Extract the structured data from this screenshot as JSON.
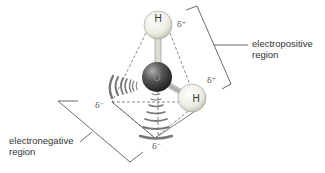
{
  "diagram": {
    "atoms": [
      {
        "id": "h_top",
        "label": "H"
      },
      {
        "id": "oxygen",
        "label": "O"
      },
      {
        "id": "h_right",
        "label": "H"
      }
    ],
    "charges": {
      "h_top": "δ⁺",
      "h_right": "δ⁺",
      "lone_pair_left": "δ⁻",
      "lone_pair_bottom": "δ⁻"
    },
    "regions": {
      "electropositive": "electropositive\nregion",
      "electronegative": "electronegative\nregion"
    },
    "colors": {
      "hydrogen_fill": "#f0f0e8",
      "oxygen_fill": "#555555",
      "lone_pair": "#777777",
      "lines": "#444444"
    }
  }
}
